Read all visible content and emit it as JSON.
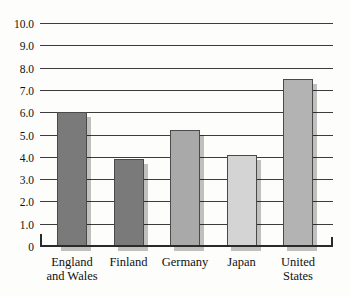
{
  "chart_data": {
    "type": "bar",
    "title": "",
    "xlabel": "",
    "ylabel": "",
    "categories": [
      "England\nand Wales",
      "Finland",
      "Germany",
      "Japan",
      "United\nStates"
    ],
    "values": [
      6.0,
      3.9,
      5.2,
      4.1,
      7.5
    ],
    "bar_colors": [
      "#7a7a7a",
      "#7a7a7a",
      "#a9a9a9",
      "#d4d4d4",
      "#b3b3b3"
    ],
    "bar_border_color": "#4a4a4a",
    "shadow_color": "rgba(0,0,0,0.24)",
    "ylim": [
      0,
      10
    ],
    "yticks": {
      "values": [
        0,
        1,
        2,
        3,
        4,
        5,
        6,
        7,
        8,
        9,
        10
      ],
      "labels": [
        "0",
        "1.0",
        "2.0",
        "3.0",
        "4.0",
        "5.0",
        "6.0",
        "7.0",
        "8.0",
        "9.0",
        "10.0"
      ]
    },
    "grid": "horizontal",
    "gridline_color": "#3c3c3c",
    "legend": "none",
    "background_color": "#fdfdfb"
  }
}
